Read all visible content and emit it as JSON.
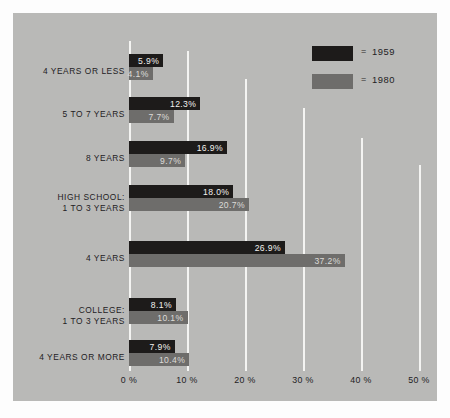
{
  "chart_data": {
    "type": "bar",
    "orientation": "horizontal",
    "title": "",
    "xlabel": "",
    "ylabel": "",
    "xlim": [
      0,
      55
    ],
    "grid": true,
    "legend_position": "top-right",
    "categories": [
      "4 YEARS OR LESS",
      "5 TO 7 YEARS",
      "8 YEARS",
      "HIGH SCHOOL:\n1 TO 3 YEARS",
      "4 YEARS",
      "COLLEGE:\n1 TO 3 YEARS",
      "4 YEARS OR MORE"
    ],
    "series": [
      {
        "name": "1959",
        "color": "#1d1b1a",
        "values": [
          5.9,
          12.3,
          16.9,
          18.0,
          26.9,
          8.1,
          7.9
        ],
        "labels": [
          "5.9%",
          "12.3%",
          "16.9%",
          "18.0%",
          "26.9%",
          "8.1%",
          "7.9%"
        ]
      },
      {
        "name": "1980",
        "color": "#6e6d6b",
        "values": [
          4.1,
          7.7,
          9.7,
          20.7,
          37.2,
          10.1,
          10.4
        ],
        "labels": [
          "4.1%",
          "7.7%",
          "9.7%",
          "20.7%",
          "37.2%",
          "10.1%",
          "10.4%"
        ]
      }
    ],
    "xticks": [
      0,
      10,
      20,
      30,
      40,
      50
    ],
    "xtick_labels": [
      "0 %",
      "10 %",
      "20 %",
      "30 %",
      "40 %",
      "50 %"
    ]
  },
  "legend": {
    "equals_symbol": "=",
    "entries": [
      {
        "label": "1959",
        "color": "#1d1b1a"
      },
      {
        "label": "1980",
        "color": "#6e6d6b"
      }
    ]
  },
  "colors": {
    "panel_background": "#b9b9b7",
    "page_background": "#fdfdfd",
    "gridline": "#f4f4f2",
    "series_1959": "#1d1b1a",
    "series_1980": "#6e6d6b",
    "text": "#23211f"
  }
}
